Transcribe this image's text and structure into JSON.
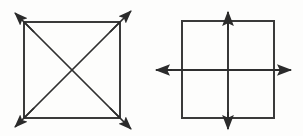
{
  "document": {
    "title": "Two Square Diagrams",
    "background_color": "#fdfdfc",
    "ink_color": "#2b2b2b",
    "width": 303,
    "height": 136,
    "style": "scanned black-and-white line drawing"
  },
  "figures": [
    {
      "id": "left-figure",
      "name": "square-with-diagonals",
      "description": "Square with both diagonals drawn, each diagonal extending past the four corners and terminating in an outward-pointing solid arrowhead",
      "square": {
        "left": 24,
        "top": 22,
        "right": 120,
        "bottom": 118,
        "stroke_color": "#3a3a3a",
        "stroke_width": 2.0
      },
      "diagonals": [
        {
          "name": "diagonal-top-left-to-bottom-right",
          "x1": 24,
          "y1": 22,
          "x2": 120,
          "y2": 118
        },
        {
          "name": "diagonal-top-right-to-bottom-left",
          "x1": 120,
          "y1": 22,
          "x2": 24,
          "y2": 118
        }
      ],
      "arrows": [
        {
          "name": "arrow-top-left",
          "from_x": 34,
          "from_y": 32,
          "to_x": 15,
          "to_y": 13
        },
        {
          "name": "arrow-top-right",
          "from_x": 110,
          "from_y": 32,
          "to_x": 131,
          "to_y": 11
        },
        {
          "name": "arrow-bottom-left",
          "from_x": 34,
          "from_y": 108,
          "to_x": 15,
          "to_y": 127
        },
        {
          "name": "arrow-bottom-right",
          "from_x": 110,
          "from_y": 108,
          "to_x": 131,
          "to_y": 129
        }
      ],
      "arrow_count": 4,
      "arrow_direction": "outward along diagonals"
    },
    {
      "id": "right-figure",
      "name": "square-with-axes",
      "description": "Square with a vertical and a horizontal line through its center, both lines extending beyond the square and ending in solid arrowheads on all four ends",
      "square": {
        "left": 182,
        "top": 21,
        "right": 274,
        "bottom": 118,
        "stroke_color": "#3a3a3a",
        "stroke_width": 2.0
      },
      "axes": [
        {
          "name": "vertical-axis",
          "x1": 228,
          "y1": 16,
          "x2": 228,
          "y2": 124,
          "orientation": "vertical"
        },
        {
          "name": "horizontal-axis",
          "x1": 161,
          "y1": 70,
          "x2": 287,
          "y2": 70,
          "orientation": "horizontal"
        }
      ],
      "arrows": [
        {
          "name": "arrow-up",
          "from_x": 228,
          "from_y": 30,
          "to_x": 228,
          "to_y": 12
        },
        {
          "name": "arrow-down",
          "from_x": 228,
          "from_y": 112,
          "to_x": 228,
          "to_y": 129
        },
        {
          "name": "arrow-left",
          "from_x": 172,
          "from_y": 70,
          "to_x": 156,
          "to_y": 70
        },
        {
          "name": "arrow-right",
          "from_x": 275,
          "from_y": 70,
          "to_x": 291,
          "to_y": 70
        }
      ],
      "arrow_count": 4,
      "arrow_direction": "outward along axes",
      "center": {
        "x": 228,
        "y": 70
      }
    }
  ]
}
